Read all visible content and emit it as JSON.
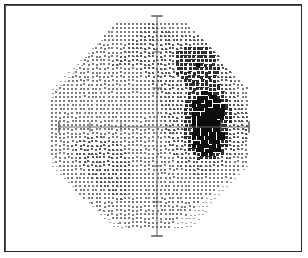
{
  "document": {
    "title": "Visual Field Grayscale Plot",
    "type": "perimetry-grayscale",
    "background_color": "#ffffff",
    "frame_color": "#2b2b2b"
  },
  "chart_data": {
    "type": "heatmap",
    "title": "Visual Field Grayscale Plot",
    "subtitle": "",
    "xlabel": "",
    "ylabel": "",
    "grid": false,
    "legend": "none",
    "xlim": [
      -30,
      30
    ],
    "ylim": [
      -30,
      30
    ],
    "axis": {
      "origin_px": [
        157,
        127
      ],
      "h_axis_start_px": [
        59,
        127
      ],
      "h_axis_end_px": [
        249,
        127
      ],
      "v_axis_start_px": [
        157,
        16
      ],
      "v_axis_end_px": [
        157,
        236
      ],
      "axis_color": "#6b6b6b",
      "x_ticks": [
        -30,
        -20,
        -10,
        10,
        20,
        30
      ],
      "y_ticks": [
        -30,
        -20,
        -10,
        10,
        20,
        30
      ],
      "x_tick_px": [
        59,
        90,
        121,
        190,
        221,
        249
      ],
      "y_tick_px": [
        16,
        52,
        88,
        166,
        202,
        236
      ],
      "tick_half_len_px": 5
    },
    "field": {
      "shape": "octagon",
      "center_px": [
        150,
        127
      ],
      "radius_x_px": 98,
      "radius_y_px": 103,
      "corner_cut": 0.38,
      "dot_grid_spacing_px": 4.05,
      "dot_base_color": "#767676",
      "description": "Octagonal dotted visual-field map with dithered grayscale shading"
    },
    "series": [
      {
        "name": "background-sensitivity",
        "description": "Light stipple across whole field, mildly denser superior-temporal",
        "mean_density": 0.2
      },
      {
        "name": "superior-temporal-depression",
        "description": "Moderate gray patch, upper right quadrant",
        "center_px": [
          200,
          62
        ],
        "radius_px": 30,
        "peak_density": 0.5
      },
      {
        "name": "blind-spot-superior-lobe",
        "description": "Dense dark scotoma just above the horizontal meridian, temporal side",
        "center_px": [
          207,
          108
        ],
        "radius_x_px": 16,
        "radius_y_px": 14,
        "peak_density": 1.0
      },
      {
        "name": "blind-spot-inferior-lobe",
        "description": "Dense dark scotoma just below the horizontal meridian, temporal side",
        "center_px": [
          207,
          140
        ],
        "radius_x_px": 15,
        "radius_y_px": 16,
        "peak_density": 1.0
      },
      {
        "name": "nasal-step-halo",
        "description": "Intermediate gray halo surrounding the blind-spot lobes",
        "center_px": [
          207,
          124
        ],
        "radius_x_px": 28,
        "radius_y_px": 38,
        "peak_density": 0.45
      },
      {
        "name": "inferior-nasal-fade",
        "description": "Sparse pale dots, lower-left of the field",
        "center_px": [
          95,
          185
        ],
        "radius_px": 55,
        "peak_density": 0.1
      }
    ]
  }
}
